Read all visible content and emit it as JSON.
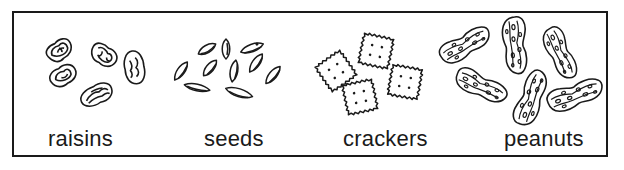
{
  "figure": {
    "panels": [
      {
        "id": "raisins",
        "label": "raisins",
        "item_count": 5,
        "icon": "raisin-icon"
      },
      {
        "id": "seeds",
        "label": "seeds",
        "item_count": 9,
        "icon": "seed-icon"
      },
      {
        "id": "crackers",
        "label": "crackers",
        "item_count": 4,
        "icon": "cracker-icon"
      },
      {
        "id": "peanuts",
        "label": "peanuts",
        "item_count": 6,
        "icon": "peanut-icon"
      }
    ],
    "colors": {
      "ink": "#1a1a1a",
      "background": "#ffffff"
    }
  }
}
